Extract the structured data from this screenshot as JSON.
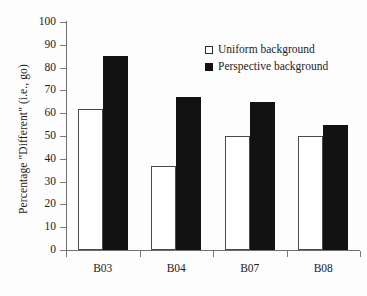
{
  "chart_data": {
    "type": "bar",
    "title": "",
    "subtitle": "",
    "xlabel": "",
    "ylabel": "Percentage \"Different\" (i.e., go)",
    "categories": [
      "B03",
      "B04",
      "B07",
      "B08"
    ],
    "series": [
      {
        "name": "Uniform background",
        "values": [
          62,
          37,
          50,
          50
        ],
        "color": "#ffffff",
        "edge_color": "#4a4a4a"
      },
      {
        "name": "Perspective background",
        "values": [
          85,
          67,
          65,
          55
        ],
        "color": "#121212",
        "edge_color": "#121212"
      }
    ],
    "ylim": [
      0,
      100
    ],
    "yticks": [
      0,
      10,
      20,
      30,
      40,
      50,
      60,
      70,
      80,
      90,
      100
    ],
    "ytick_labels": [
      "0",
      "10",
      "20",
      "30",
      "40",
      "50",
      "60",
      "70",
      "80",
      "90",
      "100"
    ],
    "grid": false,
    "legend_position": "upper right",
    "background_color": "#fdfdfd"
  },
  "legend": {
    "items": [
      {
        "label": "Uniform background",
        "swatch": "open-square"
      },
      {
        "label": "Perspective background",
        "swatch": "filled-square"
      }
    ]
  }
}
